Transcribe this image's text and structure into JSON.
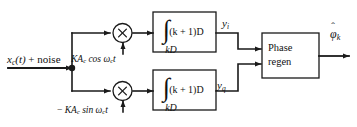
{
  "figure": {
    "background": "#ffffff",
    "line_color": "#1a1a1a"
  },
  "input": {
    "signal": "x",
    "signal_sub": "c",
    "signal_arg": "(t)",
    "plus": " + noise",
    "full_label": "x_c(t) + noise"
  },
  "carriers": {
    "inphase": {
      "prefix": "KA",
      "sub": "c",
      "func": " cos ",
      "omega": "ω",
      "omega_sub": "c",
      "time": "t",
      "full_label": "KA_c cos ω_c t"
    },
    "quadrature": {
      "sign": "− ",
      "prefix": "KA",
      "sub": "c",
      "func": " sin ",
      "omega": "ω",
      "omega_sub": "c",
      "time": "t",
      "full_label": "− KA_c sin ω_c t"
    }
  },
  "multipliers": {
    "symbol": "×",
    "inphase_name": "multiply",
    "quadrature_name": "multiply"
  },
  "integrators": {
    "symbol": "∫",
    "upper_limit": "(k + 1)D",
    "lower_limit": "kD",
    "full_label": "∫ from kD to (k + 1)D"
  },
  "outputs": {
    "inphase": {
      "base": "y",
      "sub": "i",
      "full_label": "y_i"
    },
    "quadrature": {
      "base": "y",
      "sub": "q",
      "full_label": "y_q"
    }
  },
  "phase_regen": {
    "line1": "Phase",
    "line2": "regen",
    "full_label": "Phase regen"
  },
  "final_output": {
    "base": "φ",
    "hat": "ˆ",
    "sub": "k",
    "full_label": "φ̂_k"
  }
}
